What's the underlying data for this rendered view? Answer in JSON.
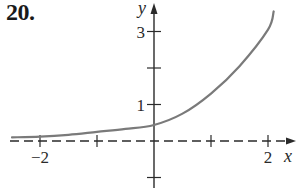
{
  "problem": {
    "number_label": "20."
  },
  "chart_data": {
    "type": "line",
    "title": "",
    "xlabel": "x",
    "ylabel": "y",
    "xlim": [
      -2.6,
      2.45
    ],
    "ylim": [
      -1.05,
      3.8
    ],
    "grid": false,
    "legend": null,
    "x_ticks": [
      -2,
      -1,
      1,
      2
    ],
    "x_tick_labels": [
      {
        "value": -2,
        "label": "−2"
      },
      {
        "value": 2,
        "label": "2"
      }
    ],
    "y_ticks": [
      -1,
      1,
      2,
      3
    ],
    "y_tick_labels": [
      {
        "value": 1,
        "label": "1"
      },
      {
        "value": 3,
        "label": "3"
      }
    ],
    "asymptote": {
      "type": "horizontal",
      "y": 0,
      "style": "dashed"
    },
    "series": [
      {
        "name": "f(x)",
        "x": [
          -2.5,
          -2.0,
          -1.5,
          -1.0,
          -0.5,
          0.0,
          0.5,
          1.0,
          1.5,
          2.0,
          2.1
        ],
        "values": [
          0.1,
          0.12,
          0.17,
          0.25,
          0.33,
          0.44,
          0.75,
          1.3,
          2.05,
          3.05,
          3.55
        ]
      }
    ],
    "colors": {
      "curve": "#7a7a7a",
      "axes": "#2a2a2a"
    }
  }
}
